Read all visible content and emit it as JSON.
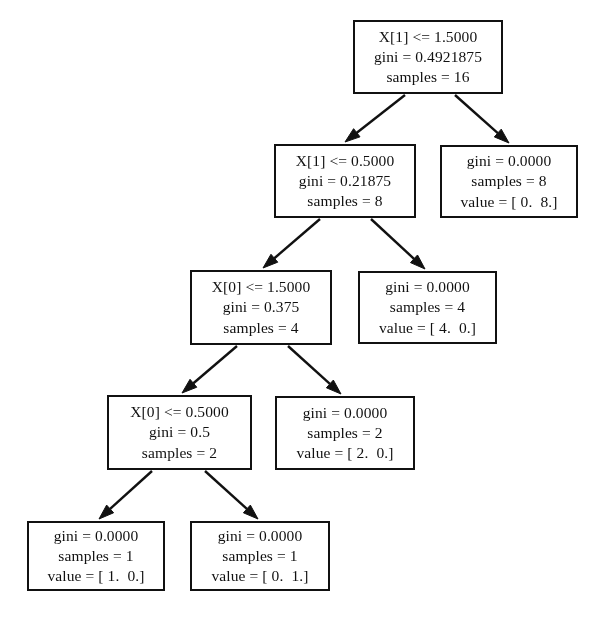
{
  "diagram": {
    "type": "decision-tree",
    "background_color": "#ffffff",
    "line_color": "#111111",
    "text_color": "#111111",
    "canvas": {
      "width": 606,
      "height": 638
    }
  },
  "nodes": [
    {
      "id": "root",
      "role": "decision",
      "box": {
        "x": 353,
        "y": 20,
        "w": 150,
        "h": 74
      },
      "lines": [
        "X[1] <= 1.5000",
        "gini = 0.4921875",
        "samples = 16"
      ],
      "condition": "X[1] <= 1.5000",
      "gini": "0.4921875",
      "samples": "16",
      "value": ""
    },
    {
      "id": "n1",
      "role": "decision",
      "box": {
        "x": 274,
        "y": 144,
        "w": 142,
        "h": 74
      },
      "lines": [
        "X[1] <= 0.5000",
        "gini = 0.21875",
        "samples = 8"
      ],
      "condition": "X[1] <= 0.5000",
      "gini": "0.21875",
      "samples": "8",
      "value": ""
    },
    {
      "id": "n2",
      "role": "leaf",
      "box": {
        "x": 440,
        "y": 145,
        "w": 138,
        "h": 73
      },
      "lines": [
        "gini = 0.0000",
        "samples = 8",
        "value = [ 0.  8.]"
      ],
      "condition": "",
      "gini": "0.0000",
      "samples": "8",
      "value": "[ 0.  8.]"
    },
    {
      "id": "n3",
      "role": "decision",
      "box": {
        "x": 190,
        "y": 270,
        "w": 142,
        "h": 75
      },
      "lines": [
        "X[0] <= 1.5000",
        "gini = 0.375",
        "samples = 4"
      ],
      "condition": "X[0] <= 1.5000",
      "gini": "0.375",
      "samples": "4",
      "value": ""
    },
    {
      "id": "n4",
      "role": "leaf",
      "box": {
        "x": 358,
        "y": 271,
        "w": 139,
        "h": 73
      },
      "lines": [
        "gini = 0.0000",
        "samples = 4",
        "value = [ 4.  0.]"
      ],
      "condition": "",
      "gini": "0.0000",
      "samples": "4",
      "value": "[ 4.  0.]"
    },
    {
      "id": "n5",
      "role": "decision",
      "box": {
        "x": 107,
        "y": 395,
        "w": 145,
        "h": 75
      },
      "lines": [
        "X[0] <= 0.5000",
        "gini = 0.5",
        "samples = 2"
      ],
      "condition": "X[0] <= 0.5000",
      "gini": "0.5",
      "samples": "2",
      "value": ""
    },
    {
      "id": "n6",
      "role": "leaf",
      "box": {
        "x": 275,
        "y": 396,
        "w": 140,
        "h": 74
      },
      "lines": [
        "gini = 0.0000",
        "samples = 2",
        "value = [ 2.  0.]"
      ],
      "condition": "",
      "gini": "0.0000",
      "samples": "2",
      "value": "[ 2.  0.]"
    },
    {
      "id": "n7",
      "role": "leaf",
      "box": {
        "x": 27,
        "y": 521,
        "w": 138,
        "h": 70
      },
      "lines": [
        "gini = 0.0000",
        "samples = 1",
        "value = [ 1.  0.]"
      ],
      "condition": "",
      "gini": "0.0000",
      "samples": "1",
      "value": "[ 1.  0.]"
    },
    {
      "id": "n8",
      "role": "leaf",
      "box": {
        "x": 190,
        "y": 521,
        "w": 140,
        "h": 70
      },
      "lines": [
        "gini = 0.0000",
        "samples = 1",
        "value = [ 0.  1.]"
      ],
      "condition": "",
      "gini": "0.0000",
      "samples": "1",
      "value": "[ 0.  1.]"
    }
  ],
  "edges": [
    {
      "id": "root-n1",
      "from": "root",
      "to": "n1",
      "x1": 405,
      "y1": 95,
      "x2": 345,
      "y2": 142
    },
    {
      "id": "root-n2",
      "from": "root",
      "to": "n2",
      "x1": 455,
      "y1": 95,
      "x2": 509,
      "y2": 143
    },
    {
      "id": "n1-n3",
      "from": "n1",
      "to": "n3",
      "x1": 320,
      "y1": 219,
      "x2": 263,
      "y2": 268
    },
    {
      "id": "n1-n4",
      "from": "n1",
      "to": "n4",
      "x1": 371,
      "y1": 219,
      "x2": 425,
      "y2": 269
    },
    {
      "id": "n3-n5",
      "from": "n3",
      "to": "n5",
      "x1": 237,
      "y1": 346,
      "x2": 182,
      "y2": 393
    },
    {
      "id": "n3-n6",
      "from": "n3",
      "to": "n6",
      "x1": 288,
      "y1": 346,
      "x2": 341,
      "y2": 394
    },
    {
      "id": "n5-n7",
      "from": "n5",
      "to": "n7",
      "x1": 152,
      "y1": 471,
      "x2": 99,
      "y2": 519
    },
    {
      "id": "n5-n8",
      "from": "n5",
      "to": "n8",
      "x1": 205,
      "y1": 471,
      "x2": 258,
      "y2": 519
    }
  ]
}
